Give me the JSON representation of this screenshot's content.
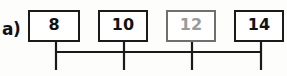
{
  "figure": {
    "item_label": "a)",
    "boxes": [
      {
        "value": "8",
        "state": "printed"
      },
      {
        "value": "10",
        "state": "printed"
      },
      {
        "value": "12",
        "state": "faded"
      },
      {
        "value": "14",
        "state": "printed"
      }
    ],
    "ink_color": "#1a1a1a",
    "faded_ink_color": "#9a9a9a",
    "background_color": "#fdfdfc"
  }
}
